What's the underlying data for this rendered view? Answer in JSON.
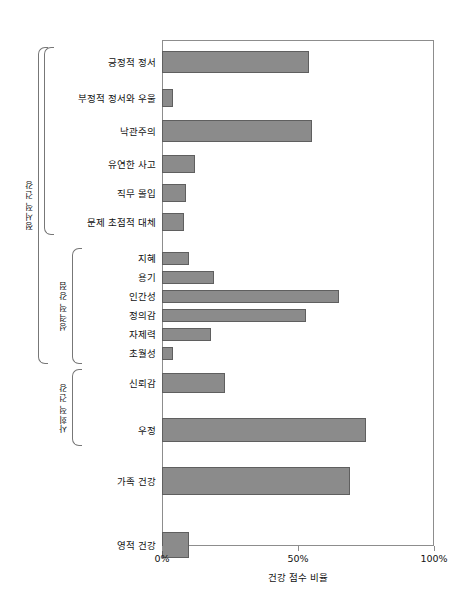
{
  "chart_data": {
    "type": "bar",
    "orientation": "horizontal",
    "title": "",
    "xlabel": "건강 점수 비율",
    "ylabel": "",
    "xlim": [
      0,
      100
    ],
    "grid": false,
    "legend": "none",
    "bar_color": "#8b8b8b",
    "bar_border_color": "#5f5f5f",
    "axis_color": "#8d8d8d",
    "xticks": [
      {
        "value": 0,
        "label": "0%"
      },
      {
        "value": 50,
        "label": "50%"
      },
      {
        "value": 100,
        "label": "100%"
      }
    ],
    "categories": [
      "긍정적 정서",
      "부정적 정서와 우울",
      "낙관주의",
      "유연한 사고",
      "직무 몰입",
      "문제 초점적 대체",
      "지혜",
      "용기",
      "인간성",
      "정의감",
      "자제력",
      "초월성",
      "신뢰감",
      "우정",
      "가족 건강",
      "영적 건강"
    ],
    "values": [
      54,
      4,
      55,
      12,
      9,
      8,
      10,
      19,
      65,
      53,
      18,
      4,
      23,
      75,
      69,
      10
    ],
    "groups": [
      {
        "label": "정서적 건강",
        "first": 0,
        "last": 5
      },
      {
        "label": "성격적 강점",
        "first": 6,
        "last": 11
      },
      {
        "label": "사회적 건강",
        "first": 12,
        "last": 13
      }
    ],
    "outer_bracket": {
      "label": "",
      "first": 0,
      "last": 11
    }
  }
}
